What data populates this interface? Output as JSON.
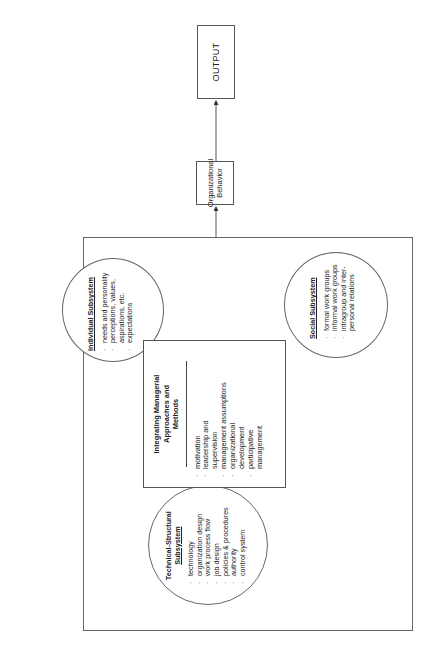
{
  "diagram": {
    "orientation": "rotated -90 degrees (reads bottom-to-top)",
    "output_box": {
      "label": "OUTPUT"
    },
    "org_behavior_box": {
      "line1": "Organizational",
      "line2": "Behavior"
    },
    "individual": {
      "title": "Individual Subsystem",
      "items": [
        "needs and personality",
        "perceptions, values,",
        "aspirations, etc.",
        "expectations"
      ],
      "bullets": [
        "·",
        "·",
        "",
        "·"
      ]
    },
    "social": {
      "title": "Social Subsystem",
      "items": [
        "formal work groups",
        "informal work groups",
        "intragroup and inter-",
        "personal relations"
      ],
      "bullets": [
        "·",
        "·",
        "·",
        ""
      ]
    },
    "technical": {
      "title_line1": "Technical-Structural",
      "title_line2": "Subsystem",
      "items": [
        "technology",
        "organization design",
        "work process flow",
        "job design",
        "policies & procedures",
        "authority",
        "control system"
      ],
      "bullets": [
        "·",
        "·",
        "·",
        "·",
        "·",
        "·",
        "·"
      ]
    },
    "center": {
      "title_line1": "Integrating Managerial",
      "title_line2": "Approaches and",
      "title_line3": "Methods",
      "items": [
        "motivation",
        "leadership and",
        "supervision",
        "management assumptions",
        "organizational",
        "development",
        "participative",
        "management"
      ],
      "bullets": [
        "·",
        "·",
        "",
        "·",
        "·",
        "",
        "·",
        ""
      ]
    },
    "colors": {
      "line": "#555555",
      "text": "#222222",
      "background": "#ffffff"
    }
  }
}
